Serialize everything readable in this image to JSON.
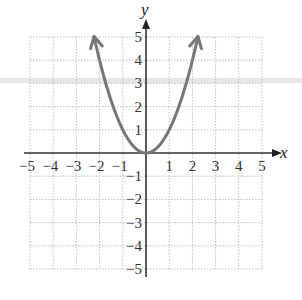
{
  "chart_data": {
    "type": "line",
    "title": "",
    "function": "y = x^2",
    "xlabel": "x",
    "ylabel": "y",
    "xlim": [
      -5,
      5
    ],
    "ylim": [
      -5,
      5
    ],
    "grid": true,
    "x_ticks": [
      "-5",
      "-4",
      "-3",
      "-2",
      "-1",
      "1",
      "2",
      "3",
      "4",
      "5"
    ],
    "y_ticks": [
      "5",
      "4",
      "3",
      "2",
      "1",
      "-1",
      "-2",
      "-3",
      "-4",
      "-5"
    ],
    "series": [
      {
        "name": "y = x^2",
        "color": "#777777",
        "arrows_at_ends": true,
        "x": [
          -2.24,
          -2,
          -1.5,
          -1,
          -0.5,
          0,
          0.5,
          1,
          1.5,
          2,
          2.24
        ],
        "y": [
          5,
          4,
          2.25,
          1,
          0.25,
          0,
          0.25,
          1,
          2.25,
          4,
          5
        ]
      }
    ]
  },
  "labels": {
    "x_axis": "x",
    "y_axis": "y"
  }
}
